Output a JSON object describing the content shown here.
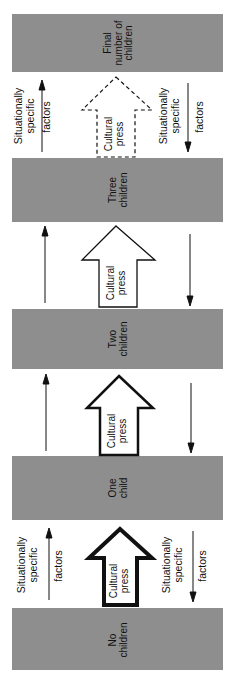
{
  "diagram": {
    "orientation": "rotated-90-ccw",
    "stages": [
      {
        "id": "final",
        "line1": "Final",
        "line2": "number of",
        "line3": "children"
      },
      {
        "id": "three",
        "line1": "Three",
        "line2": "children"
      },
      {
        "id": "two",
        "line1": "Two",
        "line2": "children"
      },
      {
        "id": "one",
        "line1": "One",
        "line2": "child"
      },
      {
        "id": "none",
        "line1": "No",
        "line2": "children"
      }
    ],
    "cultural_press": {
      "line1": "Cultural",
      "line2": "press"
    },
    "factors_left": {
      "line1": "Situationally",
      "line2": "specific",
      "line3": "factors"
    },
    "factors_right": {
      "line1": "Situationally",
      "line2": "specific",
      "line3": "factors"
    },
    "colors": {
      "block": "#8e8e8e",
      "line": "#111111",
      "background": "#ffffff"
    }
  }
}
